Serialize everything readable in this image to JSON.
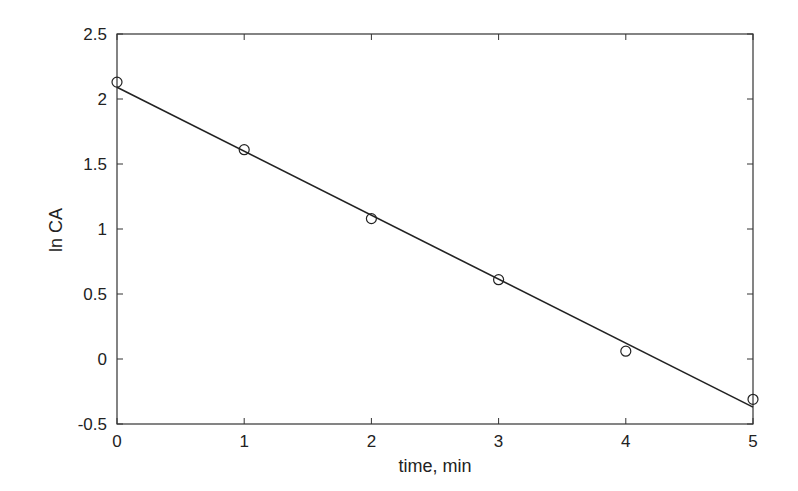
{
  "chart_data": {
    "type": "scatter",
    "title": "",
    "xlabel": "time, min",
    "ylabel": "ln CA",
    "xlim": [
      0,
      5
    ],
    "ylim": [
      -0.5,
      2.5
    ],
    "grid": false,
    "legend": null,
    "x_ticks": [
      "0",
      "1",
      "2",
      "3",
      "4",
      "5"
    ],
    "y_ticks": [
      "-0.5",
      "0",
      "0.5",
      "1",
      "1.5",
      "2",
      "2.5"
    ],
    "series": [
      {
        "name": "data",
        "marker": "open-circle",
        "x": [
          0,
          1,
          2,
          3,
          4,
          5
        ],
        "y": [
          2.13,
          1.61,
          1.08,
          0.61,
          0.06,
          -0.31
        ]
      },
      {
        "name": "linear fit",
        "style": "solid-line",
        "x": [
          0,
          5
        ],
        "y": [
          2.09,
          -0.37
        ]
      }
    ],
    "colors": {
      "line": "#222222",
      "marker": "#222222",
      "axis": "#333333"
    }
  }
}
